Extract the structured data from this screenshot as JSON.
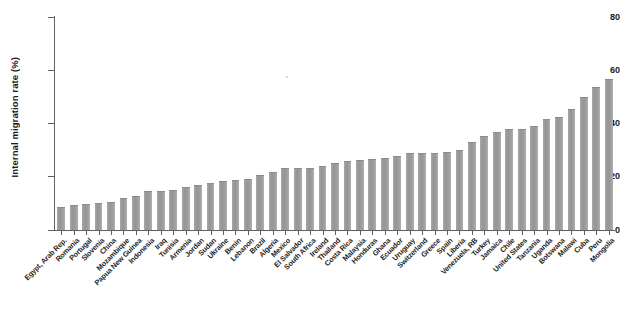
{
  "chart_data": {
    "type": "bar",
    "title": "",
    "xlabel": "",
    "ylabel": "Internal migration rate (%)",
    "ylim": [
      0,
      80
    ],
    "yticks": [
      0,
      20,
      40,
      60,
      80
    ],
    "grid": false,
    "legend": null,
    "bar_color": "#9b9b9b",
    "axis_color": "#606060",
    "categories": [
      "Egypt, Arab Rep.",
      "Romania",
      "Portugal",
      "Slovenia",
      "China",
      "Mozambique",
      "Papua New Guinea",
      "Indonesia",
      "Iraq",
      "Tunisia",
      "Armenia",
      "Jordan",
      "Sudan",
      "Ukraine",
      "Benin",
      "Lebanon",
      "Brazil",
      "Algeria",
      "Mexico",
      "El Salvador",
      "South Africa",
      "Ireland",
      "Thailand",
      "Costa Rica",
      "Malaysia",
      "Honduras",
      "Ghana",
      "Ecuador",
      "Uruguay",
      "Switzerland",
      "Greece",
      "Spain",
      "Liberia",
      "Venezuela, RB",
      "Turkey",
      "Jamaica",
      "Chile",
      "United States",
      "Tanzania",
      "Uganda",
      "Botswana",
      "Malawi",
      "Cuba",
      "Peru",
      "Mongolia"
    ],
    "values": [
      8.2,
      8.9,
      9.5,
      9.6,
      10.2,
      11.8,
      12.5,
      14.1,
      14.3,
      14.8,
      15.6,
      16.4,
      17.4,
      18.2,
      18.5,
      18.6,
      20.2,
      21.4,
      22.8,
      23.0,
      23.1,
      23.6,
      24.9,
      25.4,
      25.9,
      26.3,
      26.5,
      27.5,
      28.6,
      28.6,
      28.6,
      28.8,
      29.5,
      32.6,
      35.0,
      36.5,
      37.4,
      37.6,
      38.8,
      41.2,
      41.9,
      44.9,
      49.6,
      53.2,
      56.5
    ]
  }
}
